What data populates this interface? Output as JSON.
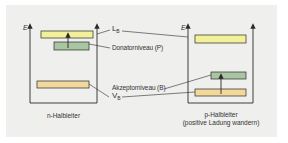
{
  "diagram": {
    "axis_label": "E",
    "colors": {
      "background_panel": "#efefed",
      "conduction_band": "#f3f09a",
      "valence_band": "#f2d89a",
      "impurity_level": "#a9c5a1",
      "stroke": "#2a2a2a"
    },
    "labels": {
      "conduction_band_main": "L",
      "conduction_band_sub": "B",
      "donor_level": "Donatorniveau (P)",
      "acceptor_level": "Akzeptorniveau (B)",
      "valence_band_main": "V",
      "valence_band_sub": "B"
    },
    "panels": [
      {
        "id": "n",
        "caption_line1": "n-Halbleiter",
        "caption_line2": ""
      },
      {
        "id": "p",
        "caption_line1": "p-Halbleiter",
        "caption_line2": "(positive Ladung wandern)"
      }
    ]
  }
}
